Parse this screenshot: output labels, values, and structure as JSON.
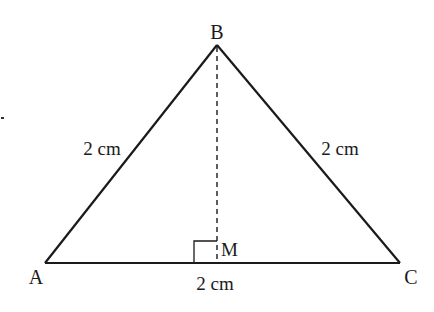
{
  "diagram": {
    "type": "isosceles triangle with altitude",
    "vertices": {
      "A": {
        "label": "A",
        "x": 45,
        "y": 263
      },
      "B": {
        "label": "B",
        "x": 217,
        "y": 45
      },
      "C": {
        "label": "C",
        "x": 400,
        "y": 263
      }
    },
    "foot": {
      "label": "M",
      "x": 217,
      "y": 263
    },
    "side_labels": {
      "AB": "2 cm",
      "BC": "2 cm",
      "AC": "2 cm"
    },
    "colors": {
      "stroke": "#1a1a1a",
      "background": "#ffffff"
    }
  }
}
